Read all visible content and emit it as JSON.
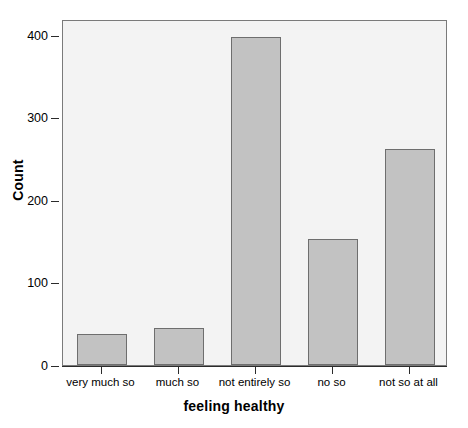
{
  "chart_data": {
    "type": "bar",
    "title": "",
    "subtitle": "",
    "xlabel": "feeling healthy",
    "ylabel": "Count",
    "categories": [
      "very much so",
      "much so",
      "not entirely so",
      "no so",
      "not so at all"
    ],
    "values": [
      37,
      45,
      397,
      153,
      262
    ],
    "ytick_labels": [
      "0",
      "100",
      "200",
      "300",
      "400"
    ],
    "ytick_values": [
      0,
      100,
      200,
      300,
      400
    ],
    "ylim": [
      0,
      419
    ],
    "xlim_note": "categorical",
    "grid": false,
    "legend": null,
    "legend_position": "none",
    "bar_fill_color": "#c2c2c2",
    "bar_edge_color": "#6e6e6e",
    "plot_background_color": "#f3f3f3",
    "frame_color": "#7a7a7a",
    "axis_color": "#2b2b2b",
    "annotations": []
  },
  "axis_labels": {
    "y_title": "Count",
    "x_title": "feeling healthy"
  }
}
